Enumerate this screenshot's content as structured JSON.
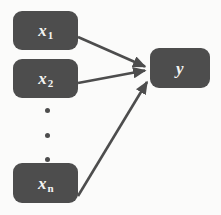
{
  "diagram": {
    "type": "node-edge-diagram",
    "canvas": {
      "width": 221,
      "height": 215
    },
    "colors": {
      "background": "#fbfbfa",
      "node_fill": "#4d4d4d",
      "node_text": "#f4f4f2",
      "edge": "#4d4d4d",
      "dot": "#4d4d4d"
    },
    "nodes": [
      {
        "id": "x1",
        "base": "x",
        "subscript": "1",
        "label": "x1",
        "role": "input",
        "x": 13,
        "y": 11,
        "width": 65,
        "height": 39
      },
      {
        "id": "x2",
        "base": "x",
        "subscript": "2",
        "label": "x2",
        "role": "input",
        "x": 13,
        "y": 59,
        "width": 65,
        "height": 39
      },
      {
        "id": "xn",
        "base": "x",
        "subscript": "n",
        "label": "xn",
        "role": "input",
        "x": 13,
        "y": 163,
        "width": 65,
        "height": 40
      },
      {
        "id": "y",
        "base": "y",
        "subscript": "",
        "label": "y",
        "role": "output",
        "x": 150,
        "y": 48,
        "width": 60,
        "height": 40
      }
    ],
    "ellipsis": {
      "orientation": "vertical",
      "count": 3,
      "meaning": "continuation of inputs between x2 and xn",
      "x": 46,
      "points_y": [
        113,
        135,
        157
      ]
    },
    "edges": [
      {
        "id": "edge-x1-y",
        "from": "x1",
        "to": "y",
        "arrowhead": "filled-triangle",
        "x1": 78,
        "y1": 37,
        "x2": 149,
        "y2": 68
      },
      {
        "id": "edge-x2-y",
        "from": "x2",
        "to": "y",
        "arrowhead": "filled-triangle",
        "x1": 78,
        "y1": 83,
        "x2": 149,
        "y2": 71
      },
      {
        "id": "edge-xn-y",
        "from": "xn",
        "to": "y",
        "arrowhead": "filled-triangle",
        "x1": 78,
        "y1": 196,
        "x2": 151,
        "y2": 80
      }
    ]
  }
}
